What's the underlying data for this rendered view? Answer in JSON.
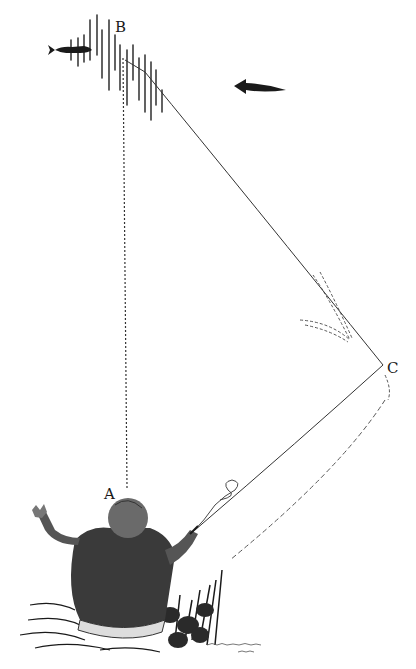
{
  "diagram": {
    "type": "pen-and-ink illustration",
    "points": {
      "A": {
        "label": "A",
        "x": 127,
        "y": 492
      },
      "B": {
        "label": "B",
        "x": 123,
        "y": 55
      },
      "C": {
        "label": "C",
        "x": 383,
        "y": 365
      }
    },
    "segments": [
      {
        "from": "B",
        "to": "A",
        "style": "dotted"
      },
      {
        "from": "B",
        "to": "C",
        "style": "solid"
      },
      {
        "from": "C",
        "to": "rod-tip",
        "style": "solid"
      }
    ],
    "current_arrow": {
      "direction": "left"
    },
    "fish": {
      "near": "B",
      "facing": "right"
    },
    "colors": {
      "ink": "#1a1a1a",
      "paper": "#ffffff"
    },
    "signature": "illegible artist signature"
  }
}
